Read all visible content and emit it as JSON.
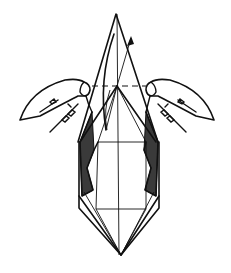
{
  "diagram": {
    "type": "origami-instruction-step",
    "colors": {
      "line": "#111111",
      "shading": "#3a3a3a",
      "background": "#ffffff"
    },
    "elements": {
      "top_flap": "triangle-flap",
      "fold_line": "valley-fold-dashed-horizontal",
      "arrow": "lift-up-arrow",
      "hands": [
        "left-hand",
        "right-hand"
      ],
      "body": "elongated-hexagonal-base",
      "shaded_regions": [
        "left-inner-flap",
        "right-inner-flap"
      ]
    }
  }
}
